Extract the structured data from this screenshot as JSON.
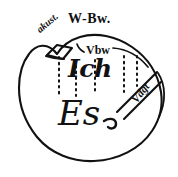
{
  "figure": {
    "background_color": "#ffffff",
    "ink_color": "#111111",
    "labels": {
      "perception_conscious": "W-Bw.",
      "acoustic": "akust.",
      "preconscious": "Vbw",
      "ego": "Ich",
      "id": "Es",
      "repressed": "Vdgt"
    },
    "parts": {
      "blob_outline": "psyche-outline",
      "acoustic_cap": "acoustic-cap",
      "dotted_barrier": "dotted-repression-lines",
      "vbw_arrow": "vbw-arrow",
      "repressed_wedge": "repressed-wedge"
    },
    "dotted_line_count": 5
  }
}
